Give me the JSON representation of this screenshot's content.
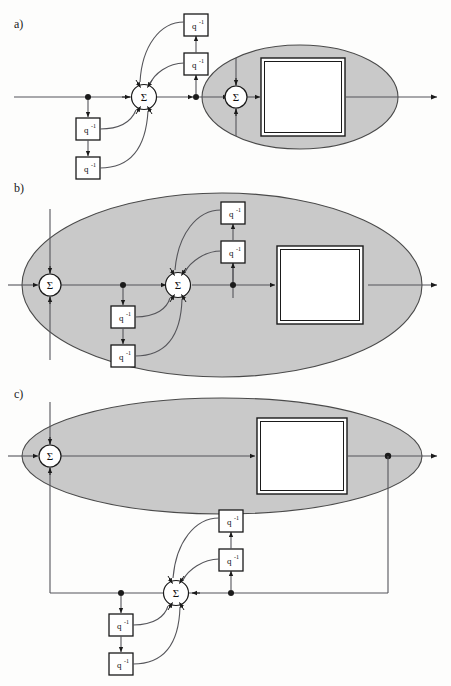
{
  "figure": {
    "panels": [
      {
        "id": "a",
        "label": "a)",
        "description": "Direct-form structure with delay chain feeding a summing junction, followed by a highlighted subsystem region",
        "highlight_region": "ellipse",
        "sum_nodes": 2,
        "delay_blocks": 4,
        "system_block_label": ""
      },
      {
        "id": "b",
        "label": "b)",
        "description": "Equivalent structure with the highlighted region enlarged to enclose the delay network and both summing junctions",
        "highlight_region": "ellipse",
        "sum_nodes": 2,
        "delay_blocks": 4,
        "system_block_label": ""
      },
      {
        "id": "c",
        "label": "c)",
        "description": "Equivalent structure with the delay network moved outside the highlighted region into an external feedback path",
        "highlight_region": "ellipse",
        "sum_nodes": 2,
        "delay_blocks": 4,
        "system_block_label": ""
      }
    ],
    "delay_block_label": "q",
    "delay_block_exponent": "-1",
    "sum_node_symbol": "Σ",
    "colors": {
      "highlight_fill": "#c9c9c9",
      "highlight_stroke": "#4a4a4a",
      "line": "#55555a",
      "block_stroke": "#1a1a1a",
      "block_fill": "#ffffff",
      "page_background": "#fdfdfc"
    },
    "caption": ""
  }
}
